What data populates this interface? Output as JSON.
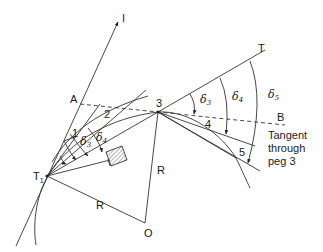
{
  "diagram": {
    "points": {
      "I": "I",
      "A": "A",
      "T1": "T",
      "T1_sub": "1",
      "T": "T",
      "B": "B",
      "O": "O",
      "peg1": "1",
      "peg2": "2",
      "peg3": "3",
      "peg4": "4",
      "peg5": "5"
    },
    "radius_labels": {
      "r1": "R",
      "r2": "R"
    },
    "angles": {
      "d3_at_T1": "δ",
      "d3_at_T1_sub": "3",
      "d4_at_T1": "δ",
      "d4_at_T1_sub": "4",
      "d3_at_3": "δ",
      "d3_at_3_sub": "3",
      "d4_at_3": "δ",
      "d4_at_3_sub": "4",
      "d5_at_3": "δ",
      "d5_at_3_sub": "5"
    },
    "annotation": {
      "line1": "Tangent",
      "line2": "through",
      "line3": "peg 3"
    },
    "colors": {
      "stroke": "#333333",
      "text": "#1a1a1a",
      "background": "#ffffff"
    }
  }
}
